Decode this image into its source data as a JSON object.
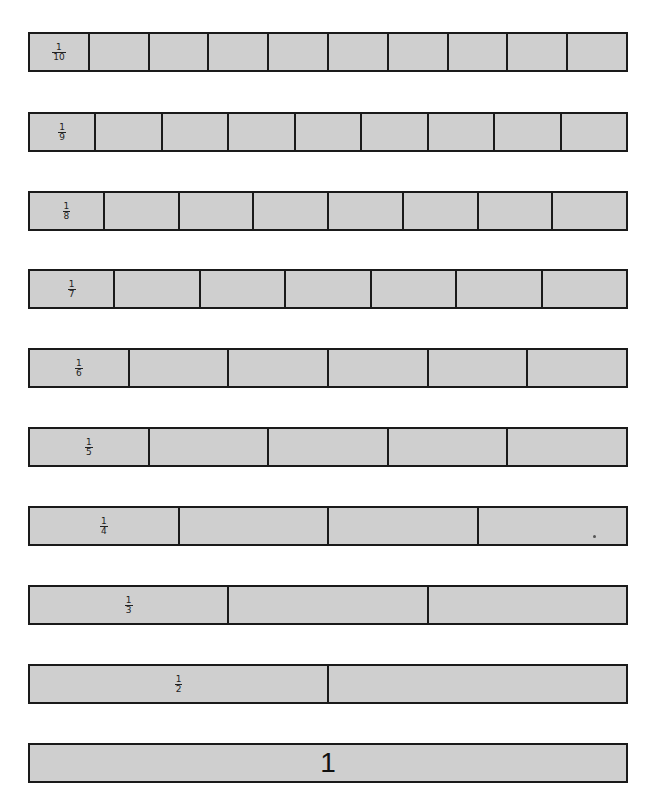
{
  "rows": [
    {
      "denominator": 10,
      "numerator": "1",
      "den_label": "10",
      "cells": 10,
      "top": 32
    },
    {
      "denominator": 9,
      "numerator": "1",
      "den_label": "9",
      "cells": 9,
      "top": 112
    },
    {
      "denominator": 8,
      "numerator": "1",
      "den_label": "8",
      "cells": 8,
      "top": 191
    },
    {
      "denominator": 7,
      "numerator": "1",
      "den_label": "7",
      "cells": 7,
      "top": 269
    },
    {
      "denominator": 6,
      "numerator": "1",
      "den_label": "6",
      "cells": 6,
      "top": 348
    },
    {
      "denominator": 5,
      "numerator": "1",
      "den_label": "5",
      "cells": 5,
      "top": 427
    },
    {
      "denominator": 4,
      "numerator": "1",
      "den_label": "4",
      "cells": 4,
      "top": 506
    },
    {
      "denominator": 3,
      "numerator": "1",
      "den_label": "3",
      "cells": 3,
      "top": 585
    },
    {
      "denominator": 2,
      "numerator": "1",
      "den_label": "2",
      "cells": 2,
      "top": 664
    }
  ],
  "whole": {
    "label": "1",
    "top": 743
  },
  "colors": {
    "fill": "#cfcfcf",
    "border": "#1a1a1a",
    "background": "#ffffff"
  }
}
